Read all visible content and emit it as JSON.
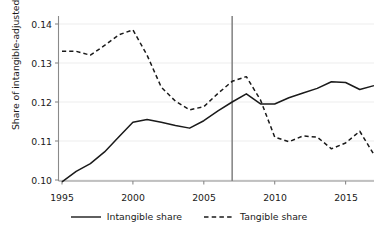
{
  "chart_data": {
    "type": "line",
    "title": "",
    "xlabel": "",
    "ylabel": "Share of intangible-adjusted GDP",
    "xlim": [
      1994.4,
      2017.6
    ],
    "ylim": [
      0.0955,
      0.1425
    ],
    "grid": true,
    "grid_orientation": "horizontal",
    "legend_position": "bottom",
    "x": [
      1995,
      1996,
      1997,
      1998,
      1999,
      2000,
      2001,
      2002,
      2003,
      2004,
      2005,
      2006,
      2007,
      2008,
      2009,
      2010,
      2011,
      2012,
      2013,
      2014,
      2015,
      2016,
      2017
    ],
    "xticks": [
      1995,
      2000,
      2005,
      2010,
      2015
    ],
    "xtick_labels": [
      "1995",
      "2000",
      "2005",
      "2010",
      "2015"
    ],
    "yticks": [
      0.1,
      0.11,
      0.12,
      0.13,
      0.14
    ],
    "ytick_labels": [
      "0.10",
      "0.11",
      "0.12",
      "0.13",
      "0.14"
    ],
    "series": [
      {
        "name": "Intangible share",
        "style": "solid",
        "color": "#1a1a1a",
        "values": [
          0.0995,
          0.1022,
          0.1042,
          0.1072,
          0.111,
          0.1148,
          0.1155,
          0.1148,
          0.114,
          0.1133,
          0.1152,
          0.1177,
          0.12,
          0.1221,
          0.1195,
          0.1195,
          0.1211,
          0.1223,
          0.1235,
          0.1252,
          0.125,
          0.1232,
          0.1242
        ]
      },
      {
        "name": "Tangible share",
        "style": "dashed",
        "color": "#1a1a1a",
        "values": [
          0.133,
          0.133,
          0.132,
          0.1345,
          0.1372,
          0.1385,
          0.132,
          0.1238,
          0.1202,
          0.118,
          0.1188,
          0.1222,
          0.1253,
          0.1265,
          0.1205,
          0.111,
          0.1098,
          0.1113,
          0.111,
          0.108,
          0.1095,
          0.1125,
          0.1065
        ]
      }
    ],
    "annotations": [
      {
        "type": "vline",
        "name": "reference-line-2007",
        "x": 2007,
        "color": "#808080",
        "label": ""
      }
    ]
  },
  "legend": {
    "items": [
      {
        "label": "Intangible share",
        "style": "solid"
      },
      {
        "label": "Tangible share",
        "style": "dashed"
      }
    ]
  },
  "axes": {
    "y_label": "Share of intangible-adjusted GDP",
    "y_tick_0": "0.10",
    "y_tick_1": "0.11",
    "y_tick_2": "0.12",
    "y_tick_3": "0.13",
    "y_tick_4": "0.14",
    "x_tick_0": "1995",
    "x_tick_1": "2000",
    "x_tick_2": "2005",
    "x_tick_3": "2010",
    "x_tick_4": "2015"
  }
}
